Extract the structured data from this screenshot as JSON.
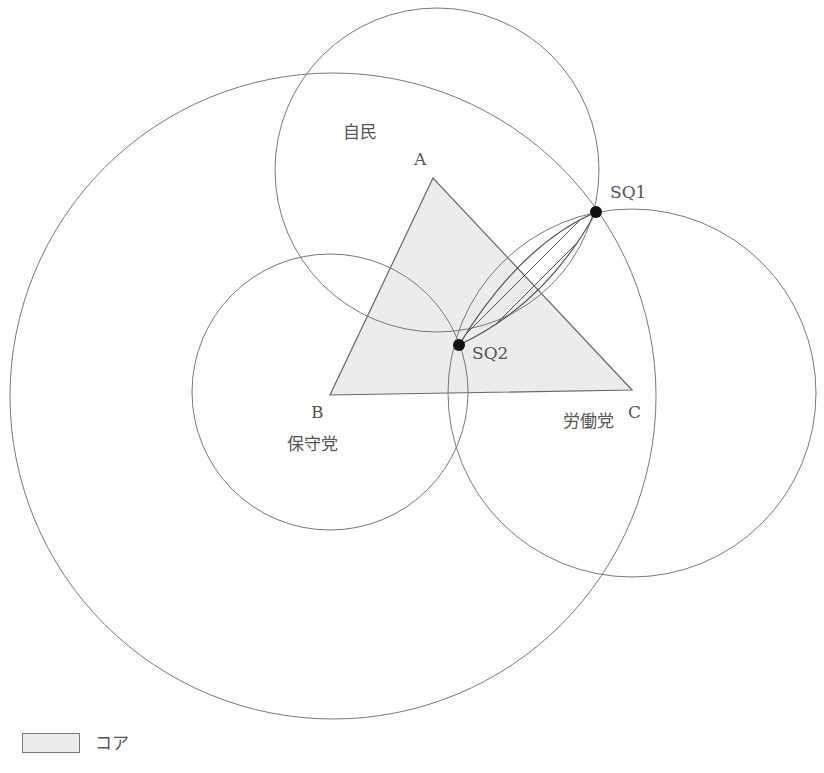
{
  "diagram": {
    "title": "",
    "colors": {
      "stroke": "#777777",
      "core_fill": "#ececec",
      "point": "#111111",
      "hatch": "#555555"
    },
    "vertices": [
      {
        "id": "A",
        "label": "A",
        "x": 433,
        "y": 178
      },
      {
        "id": "B",
        "label": "B",
        "x": 330,
        "y": 395
      },
      {
        "id": "C",
        "label": "C",
        "x": 632,
        "y": 390
      }
    ],
    "circles": [
      {
        "id": "jimin",
        "label": "自民",
        "cx": 437,
        "cy": 170,
        "r": 162
      },
      {
        "id": "hoshu",
        "label": "保守党",
        "cx": 330,
        "cy": 392,
        "r": 138
      },
      {
        "id": "rodo",
        "label": "労働党",
        "cx": 632,
        "cy": 393,
        "r": 184
      },
      {
        "id": "large",
        "label": "",
        "cx": 333,
        "cy": 396,
        "r": 323
      }
    ],
    "points": [
      {
        "id": "SQ1",
        "label": "SQ1",
        "x": 596,
        "y": 212
      },
      {
        "id": "SQ2",
        "label": "SQ2",
        "x": 459,
        "y": 345
      }
    ],
    "labels": {
      "jimin": "自民",
      "hoshu": "保守党",
      "rodo": "労働党",
      "A": "A",
      "B": "B",
      "C": "C",
      "sq1": "SQ1",
      "sq2": "SQ2"
    },
    "legend": {
      "core_label": "コア"
    }
  }
}
